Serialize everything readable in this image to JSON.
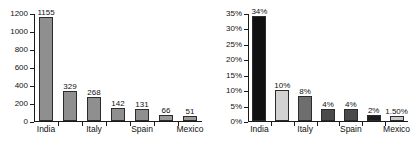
{
  "chart_data": [
    {
      "type": "bar",
      "title": "",
      "xlabel": "",
      "ylabel": "",
      "grid": false,
      "legend": "none",
      "ylim": [
        0,
        1200
      ],
      "yticks": [
        "0",
        "200",
        "400",
        "600",
        "800",
        "1000",
        "1200"
      ],
      "ytick_values": [
        0,
        200,
        400,
        600,
        800,
        1000,
        1200
      ],
      "categories": [
        "India",
        "",
        "Italy",
        "",
        "Spain",
        "",
        "Mexico"
      ],
      "tick_labels": [
        "India",
        "Italy",
        "Spain",
        "Mexico"
      ],
      "values": [
        1155,
        329,
        268,
        142,
        131,
        66,
        51
      ],
      "value_labels": [
        "1155",
        "329",
        "268",
        "142",
        "131",
        "66",
        "51"
      ],
      "bar_colors": [
        "#8f8f8f",
        "#8f8f8f",
        "#8f8f8f",
        "#8f8f8f",
        "#8f8f8f",
        "#9a9a9a",
        "#9a9a9a"
      ]
    },
    {
      "type": "bar",
      "title": "",
      "xlabel": "",
      "ylabel": "",
      "grid": false,
      "legend": "none",
      "ylim": [
        0,
        35
      ],
      "yticks": [
        "0%",
        "5%",
        "10%",
        "15%",
        "20%",
        "25%",
        "30%",
        "35%"
      ],
      "ytick_values": [
        0,
        5,
        10,
        15,
        20,
        25,
        30,
        35
      ],
      "categories": [
        "India",
        "",
        "Italy",
        "",
        "Spain",
        "",
        "Mexico"
      ],
      "tick_labels": [
        "India",
        "Italy",
        "Spain",
        "Mexico"
      ],
      "values": [
        34,
        10,
        8,
        4,
        4,
        2,
        1.5
      ],
      "value_labels": [
        "34%",
        "10%",
        "8%",
        "4%",
        "4%",
        "2%",
        "1.50%"
      ],
      "bar_colors": [
        "#111111",
        "#d2d2d2",
        "#6e6e6e",
        "#4a4a4a",
        "#4a4a4a",
        "#1c1c1c",
        "#c8c8c8"
      ]
    }
  ],
  "colors": {
    "axis": "#1a1a1a",
    "text": "#111111",
    "background": "#ffffff"
  }
}
